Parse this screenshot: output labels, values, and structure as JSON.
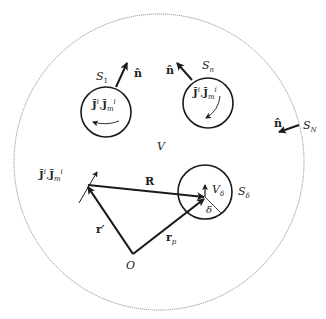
{
  "diagram": {
    "type": "electromagnetic volume with scatterers",
    "colors": {
      "stroke": "#1a1a1a",
      "outer_boundary": "#777777",
      "background": "#ffffff"
    },
    "outer_region": {
      "volume_label": "V",
      "boundary_label": "S",
      "boundary_sub": "N",
      "normal_label": "n̂"
    },
    "scatterers": [
      {
        "id": "S1",
        "label": "S",
        "sub": "1",
        "normal_label": "n̂",
        "sources_label": "J̃",
        "sources_sup": "i",
        "sep": ",",
        "sources_label_m": "J̃",
        "sources_m_sub": "m",
        "sources_m_sup": "i"
      },
      {
        "id": "Sn",
        "label": "S",
        "sub": "n",
        "normal_label": "n̂",
        "sources_label": "J̃",
        "sources_sup": "i",
        "sep": ",",
        "sources_label_m": "J̃",
        "sources_m_sub": "m",
        "sources_m_sup": "i"
      }
    ],
    "small_sphere": {
      "surface_label": "S",
      "surface_sub": "δ",
      "volume_label": "V",
      "volume_sub": "δ",
      "radius_label": "δ"
    },
    "source_point": {
      "sources_label": "J̃",
      "sources_sup": "i",
      "sep": ",",
      "sources_label_m": "J̃",
      "sources_m_sub": "m",
      "sources_m_sup": "i"
    },
    "vectors": {
      "R": "R",
      "r_prime": "r′",
      "r_p": "r",
      "r_p_sub": "p",
      "origin": "O"
    }
  }
}
